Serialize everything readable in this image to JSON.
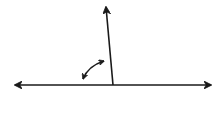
{
  "diagram": {
    "type": "angle-diagram",
    "colors": {
      "stroke": "#1a1a1a",
      "background": "#ffffff"
    },
    "line": {
      "x1": 15,
      "y1": 85,
      "x2": 211,
      "y2": 85,
      "arrows": "both"
    },
    "ray": {
      "x1": 113,
      "y1": 85,
      "x2": 106,
      "y2": 7,
      "arrows": "end"
    },
    "angle_arc": {
      "start": [
        82,
        80
      ],
      "end": [
        105,
        60
      ],
      "arrows": "both"
    }
  }
}
